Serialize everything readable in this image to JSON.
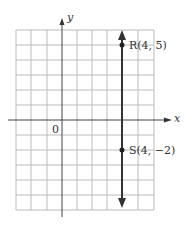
{
  "diagram": {
    "axes": {
      "x_label": "x",
      "y_label": "y",
      "origin_label": "0"
    },
    "grid": {
      "cols": 9,
      "rows": 12,
      "x_min": -3,
      "x_max": 6,
      "y_min": -6,
      "y_max": 6
    },
    "line": {
      "type": "vertical",
      "equation": "x = 4"
    },
    "points": [
      {
        "name": "R",
        "label": "R(4, 5)",
        "x": 4,
        "y": 5
      },
      {
        "name": "S",
        "label": "S(4, −2)",
        "x": 4,
        "y": -2
      }
    ]
  }
}
